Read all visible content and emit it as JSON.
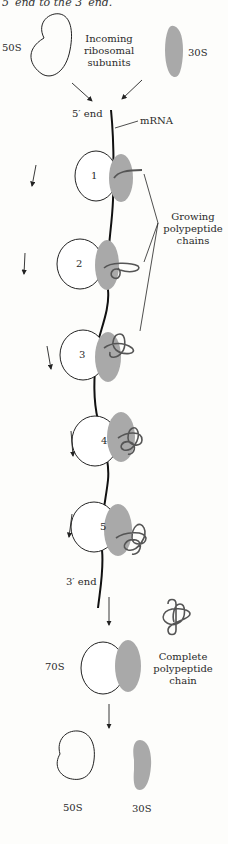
{
  "caption": "5′ end to the 3′ end.",
  "top": {
    "large_subunit_label": "50S",
    "small_subunit_label": "30S",
    "incoming_label": [
      "Incoming",
      "ribosomal",
      "subunits"
    ]
  },
  "mrna": {
    "five_prime_label": "5′ end",
    "three_prime_label": "3′ end",
    "mrna_label": "mRNA"
  },
  "ribosomes": [
    {
      "number": "1"
    },
    {
      "number": "2"
    },
    {
      "number": "3"
    },
    {
      "number": "4"
    },
    {
      "number": "5"
    }
  ],
  "growing_label": [
    "Growing",
    "polypeptide",
    "chains"
  ],
  "complete": {
    "ribosome_label": "70S",
    "chain_label": [
      "Complete",
      "polypeptide",
      "chain"
    ]
  },
  "bottom": {
    "large_subunit_label": "50S",
    "small_subunit_label": "30S"
  },
  "colors": {
    "line": "#1a1a1a",
    "subunit_small_fill": "#a9a9a9",
    "chain": "#555555"
  }
}
